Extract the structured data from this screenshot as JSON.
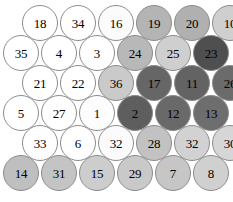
{
  "figure": {
    "type": "hexagonal-node-map",
    "node_shape": "circle",
    "node_count": 36,
    "rows": 6,
    "columns": 6,
    "node_diameter_px": 36,
    "row_vertical_step_px": 30,
    "column_horizontal_step_px": 38,
    "odd_row_indent_px": 19,
    "background_color": "#ffffff",
    "border_color": "#8c8c8c",
    "label_color": "#000000"
  },
  "palette": {
    "white": "#ffffff",
    "near_white": "#fbfbfb",
    "lightest_gray": "#f0f0f0",
    "light_gray": "#d8d8d8",
    "medium_light_gray": "#cacaca",
    "medium_gray": "#b4b4b4",
    "medium_dark_gray": "#9a9a9a",
    "dark_gray": "#6e6e6e",
    "darker_gray": "#5e5e5e",
    "darkest_gray": "#4a4a4a"
  },
  "chart_data": {
    "type": "heatmap",
    "title": "",
    "xlabel": "",
    "ylabel": "",
    "legend": [],
    "grid": false,
    "layout": "hexagonal-staggered",
    "rows": [
      {
        "row_index": 0,
        "offset": true,
        "cells": [
          {
            "label": "18",
            "value": 18,
            "shade": "#ffffff"
          },
          {
            "label": "34",
            "value": 34,
            "shade": "#ffffff"
          },
          {
            "label": "16",
            "value": 16,
            "shade": "#fbfbfb"
          },
          {
            "label": "19",
            "value": 19,
            "shade": "#b4b4b4"
          },
          {
            "label": "20",
            "value": 20,
            "shade": "#b0b0b0"
          },
          {
            "label": "10",
            "value": 10,
            "shade": "#cfcfcf"
          }
        ]
      },
      {
        "row_index": 1,
        "offset": false,
        "cells": [
          {
            "label": "35",
            "value": 35,
            "shade": "#ffffff"
          },
          {
            "label": "4",
            "value": 4,
            "shade": "#ffffff"
          },
          {
            "label": "3",
            "value": 3,
            "shade": "#ffffff"
          },
          {
            "label": "24",
            "value": 24,
            "shade": "#b8b8b8"
          },
          {
            "label": "25",
            "value": 25,
            "shade": "#cfcfcf"
          },
          {
            "label": "23",
            "value": 23,
            "shade": "#4f4f4f"
          }
        ]
      },
      {
        "row_index": 2,
        "offset": true,
        "cells": [
          {
            "label": "21",
            "value": 21,
            "shade": "#ffffff"
          },
          {
            "label": "22",
            "value": 22,
            "shade": "#ffffff"
          },
          {
            "label": "36",
            "value": 36,
            "shade": "#cacaca"
          },
          {
            "label": "17",
            "value": 17,
            "shade": "#666666"
          },
          {
            "label": "11",
            "value": 11,
            "shade": "#636363"
          },
          {
            "label": "26",
            "value": 26,
            "shade": "#6b6b6b"
          }
        ]
      },
      {
        "row_index": 3,
        "offset": false,
        "cells": [
          {
            "label": "5",
            "value": 5,
            "shade": "#ffffff"
          },
          {
            "label": "27",
            "value": 27,
            "shade": "#ffffff"
          },
          {
            "label": "1",
            "value": 1,
            "shade": "#fdfdfd"
          },
          {
            "label": "2",
            "value": 2,
            "shade": "#5e5e5e"
          },
          {
            "label": "12",
            "value": 12,
            "shade": "#696969"
          },
          {
            "label": "13",
            "value": 13,
            "shade": "#6e6e6e"
          }
        ]
      },
      {
        "row_index": 4,
        "offset": true,
        "cells": [
          {
            "label": "33",
            "value": 33,
            "shade": "#ffffff"
          },
          {
            "label": "6",
            "value": 6,
            "shade": "#ffffff"
          },
          {
            "label": "32",
            "value": 32,
            "shade": "#fbfbfb"
          },
          {
            "label": "28",
            "value": 28,
            "shade": "#c2c2c2"
          },
          {
            "label": "32",
            "value": 32,
            "shade": "#d2d2d2"
          },
          {
            "label": "30",
            "value": 30,
            "shade": "#d6d6d6"
          }
        ]
      },
      {
        "row_index": 5,
        "offset": false,
        "cells": [
          {
            "label": "14",
            "value": 14,
            "shade": "#bfbfbf"
          },
          {
            "label": "31",
            "value": 31,
            "shade": "#c4c4c4"
          },
          {
            "label": "15",
            "value": 15,
            "shade": "#cdcdcd"
          },
          {
            "label": "29",
            "value": 29,
            "shade": "#c9c9c9"
          },
          {
            "label": "7",
            "value": 7,
            "shade": "#c6c6c6"
          },
          {
            "label": "8",
            "value": 8,
            "shade": "#d0d0d0"
          }
        ]
      }
    ]
  }
}
